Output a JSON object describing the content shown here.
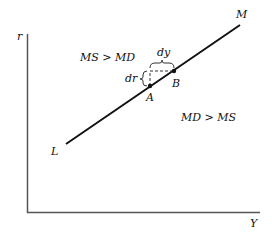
{
  "axes": {
    "y_label": "r",
    "x_label": "Y"
  },
  "line": {
    "start_label": "L",
    "end_label": "M"
  },
  "points": {
    "a_label": "A",
    "b_label": "B"
  },
  "increments": {
    "dy_label": "dy",
    "dr_label": "dr"
  },
  "regions": {
    "upper_left": "MS > MD",
    "lower_right": "MD > MS"
  },
  "colors": {
    "line": "#111111",
    "axis": "#555555"
  }
}
